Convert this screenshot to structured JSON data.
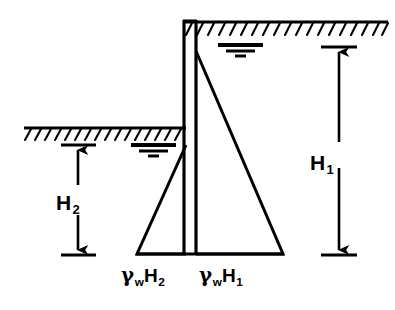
{
  "figure": {
    "type": "engineering-diagram",
    "stroke_color": "#000000",
    "background_color": "#ffffff"
  },
  "dimensions": {
    "h1": {
      "symbol": "H",
      "subscript": "1",
      "description": "depth of water on right (deep) side"
    },
    "h2": {
      "symbol": "H",
      "subscript": "2",
      "description": "depth of water on left (shallow) side"
    }
  },
  "pressures": {
    "left": {
      "gamma": "γ",
      "gamma_sub": "w",
      "symbol": "H",
      "subscript": "2"
    },
    "right": {
      "gamma": "γ",
      "gamma_sub": "w",
      "symbol": "H",
      "subscript": "1"
    }
  },
  "elements": {
    "wall": "vertical-retaining-wall",
    "ground_line_upper": "ground-surface-right-high-side",
    "ground_line_lower": "ground-surface-left-low-side",
    "water_table_upper": "water-table-symbol-right",
    "water_table_lower": "water-table-symbol-left",
    "pressure_triangle_left": "hydrostatic-pressure-triangle-left",
    "pressure_triangle_right": "hydrostatic-pressure-triangle-right"
  },
  "geometry": {
    "wall_x_left": 184,
    "wall_x_right": 196,
    "wall_top_y": 20,
    "base_y": 254,
    "ground_upper_y": 22,
    "ground_upper_x_end": 388,
    "ground_lower_y": 128,
    "ground_lower_x_start": 24,
    "tri_left_apex_y": 145,
    "tri_left_base_x": 137,
    "tri_right_apex_y": 51,
    "tri_right_base_x": 283,
    "h1_top_y": 47,
    "h1_bottom_y": 255,
    "h1_x": 339,
    "h2_top_y": 145,
    "h2_bottom_y": 255,
    "h2_x": 78
  }
}
